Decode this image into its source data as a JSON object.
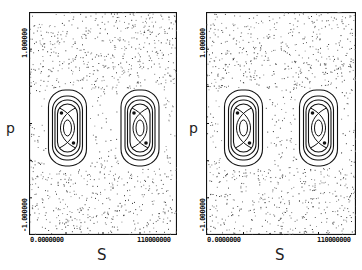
{
  "chart_data": [
    {
      "type": "scatter",
      "title": "",
      "xlabel": "S",
      "ylabel": "p",
      "x_ticks": [
        "0.0000000",
        "110000000"
      ],
      "y_ticks": [
        "-1.000000",
        "1.000000"
      ],
      "xlim": [
        0,
        110000000
      ],
      "ylim": [
        -1,
        1
      ],
      "grid": false,
      "legend": null,
      "description": "Poincare phase-space section: chaotic scatter with two resonance islands (nested contour curves)",
      "islands": [
        {
          "center_s_frac": 0.26,
          "center_p": 0.0,
          "nested_curves": 4
        },
        {
          "center_s_frac": 0.75,
          "center_p": 0.0,
          "nested_curves": 4
        }
      ]
    },
    {
      "type": "scatter",
      "title": "",
      "xlabel": "S",
      "ylabel": "p",
      "x_ticks": [
        "0.0000000",
        "110000000"
      ],
      "y_ticks": [
        "-1.000000",
        "1.000000"
      ],
      "xlim": [
        0,
        110000000
      ],
      "ylim": [
        -1,
        1
      ],
      "grid": false,
      "legend": null,
      "description": "Poincare phase-space section: chaotic scatter with two resonance islands (nested contour curves)",
      "islands": [
        {
          "center_s_frac": 0.25,
          "center_p": 0.0,
          "nested_curves": 4
        },
        {
          "center_s_frac": 0.75,
          "center_p": 0.0,
          "nested_curves": 4
        }
      ]
    }
  ],
  "panels": [
    {
      "xlabel": "S",
      "ylabel": "p",
      "xtick_left": "0.0000000",
      "xtick_right": "110000000",
      "ytick_top": "1.000000",
      "ytick_bottom": "-1.000000"
    },
    {
      "xlabel": "S",
      "ylabel": "p",
      "xtick_left": "0.0000000",
      "xtick_right": "110000000",
      "ytick_top": "1.000000",
      "ytick_bottom": "-1.000000"
    }
  ]
}
